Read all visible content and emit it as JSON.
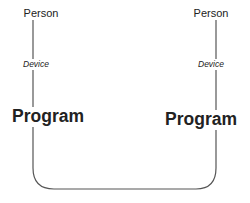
{
  "diagram": {
    "left": {
      "person": "Person",
      "device": "Device",
      "program": "Program"
    },
    "right": {
      "person": "Person",
      "device": "Device",
      "program": "Program"
    },
    "connector": {
      "type": "rounded-u",
      "color": "#555555"
    }
  }
}
